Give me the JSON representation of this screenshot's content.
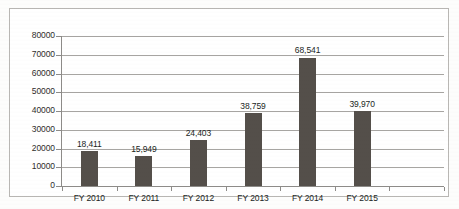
{
  "chart_data": {
    "type": "bar",
    "title": "",
    "subtitle": "",
    "xlabel": "",
    "ylabel": "",
    "categories": [
      "FY 2010",
      "FY 2011",
      "FY 2012",
      "FY 2013",
      "FY 2014",
      "FY 2015"
    ],
    "values": [
      18411,
      15949,
      24403,
      38759,
      68541,
      39970
    ],
    "data_labels": [
      "18,411",
      "15,949",
      "24,403",
      "38,759",
      "68,541",
      "39,970"
    ],
    "series": [
      {
        "name": "",
        "values": [
          18411,
          15949,
          24403,
          38759,
          68541,
          39970
        ],
        "color": "#544F4A"
      }
    ],
    "ylim": [
      0,
      80000
    ],
    "ytick_step": 10000,
    "ytick_labels": [
      "80000",
      "70000",
      "60000",
      "50000",
      "40000",
      "30000",
      "20000",
      "10000",
      "0"
    ],
    "ytick_values": [
      80000,
      70000,
      60000,
      50000,
      40000,
      30000,
      20000,
      10000,
      0
    ],
    "grid": "horizontal",
    "legend": "none",
    "bar_color": "#544F4A",
    "gridline_color": "#A7A5A2",
    "axis_color": "#8D8B88",
    "text_color": "#211F1D",
    "frame_color": "#B9B7B4",
    "background_color": "#FFFFFF"
  }
}
